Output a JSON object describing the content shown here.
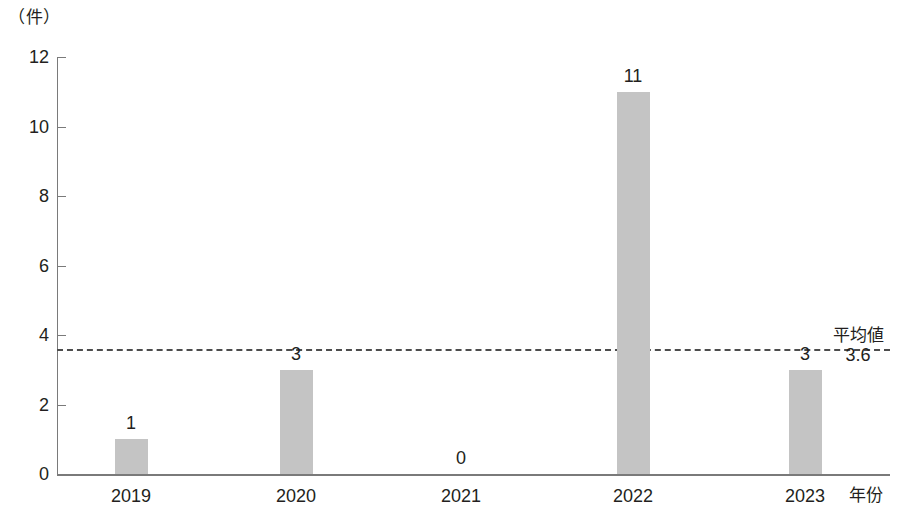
{
  "chart_data": {
    "type": "bar",
    "title": "",
    "subtitle": "",
    "xlabel": "年份",
    "ylabel": "（件）",
    "categories": [
      "2019",
      "2020",
      "2021",
      "2022",
      "2023"
    ],
    "values": [
      1,
      3,
      0,
      11,
      3
    ],
    "value_labels": [
      "1",
      "3",
      "0",
      "11",
      "3"
    ],
    "ylim": [
      0,
      12
    ],
    "ytick_labels": [
      "0",
      "2",
      "4",
      "6",
      "8",
      "10",
      "12"
    ],
    "ytick_values": [
      0,
      2,
      4,
      6,
      8,
      10,
      12
    ],
    "grid": false,
    "legend": null,
    "bar_color": "#c4c4c4",
    "axis_color": "#7a7a7a",
    "text_color": "#231f20",
    "annotations": [
      {
        "type": "average-line",
        "label": "平均値",
        "value": 3.6,
        "value_text": "3.6",
        "style": "dashed",
        "color": "#4d4d4d"
      }
    ]
  }
}
